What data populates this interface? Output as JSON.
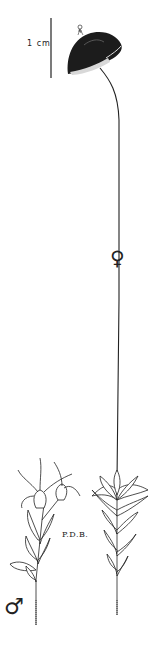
{
  "illustration": {
    "subject": "moss plant illustration (female with sporophyte capsule, male plant)",
    "scale_bar": {
      "label": "1 cm"
    },
    "symbols": {
      "female": "♀",
      "male": "♂"
    },
    "signature": "P.D.B.",
    "colors": {
      "ink": "#1a1a1a",
      "background": "#ffffff"
    }
  }
}
